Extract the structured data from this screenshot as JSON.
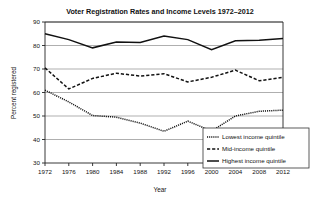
{
  "chart_data": {
    "type": "line",
    "title": "Voter Registration Rates and Income Levels 1972–2012",
    "xlabel": "Year",
    "ylabel": "Percent registered",
    "grid": true,
    "legend_position": "bottom-right",
    "xlim": [
      1972,
      2012
    ],
    "ylim": [
      30,
      90
    ],
    "yticks": [
      30,
      40,
      50,
      60,
      70,
      80,
      90
    ],
    "x": [
      1972,
      1976,
      1980,
      1984,
      1988,
      1992,
      1996,
      2000,
      2004,
      2008,
      2012
    ],
    "categories": [
      "1972",
      "1976",
      "1980",
      "1984",
      "1988",
      "1992",
      "1996",
      "2000",
      "2004",
      "2008",
      "2012"
    ],
    "series": [
      {
        "name": "Lowest income quintile",
        "style": "dotted",
        "values": [
          61,
          56,
          50.2,
          49.5,
          47,
          43.5,
          47.8,
          43.6,
          50,
          52,
          52.5
        ]
      },
      {
        "name": "Mid-income quintile",
        "style": "dashed",
        "values": [
          70.5,
          61.5,
          66,
          68.2,
          67,
          68,
          64.5,
          66.5,
          69.5,
          65,
          66.5
        ]
      },
      {
        "name": "Highest income quintile",
        "style": "solid",
        "values": [
          85,
          82.5,
          79,
          81.5,
          81.3,
          84,
          82.5,
          78.2,
          82,
          82.2,
          83
        ]
      }
    ]
  },
  "legend": {
    "items": [
      {
        "label": "Lowest income quintile",
        "style": "dotted"
      },
      {
        "label": "Mid-income quintile",
        "style": "dashed"
      },
      {
        "label": "Highest income quintile",
        "style": "solid"
      }
    ]
  }
}
